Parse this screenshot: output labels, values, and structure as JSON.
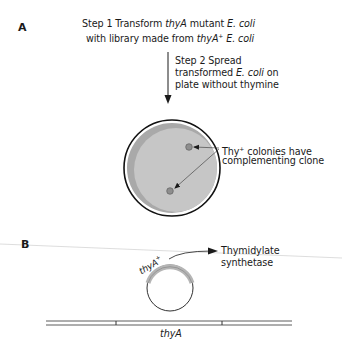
{
  "panel_a": {
    "label": "A",
    "step1": {
      "prefix": "Step 1   Transform ",
      "gene1": "thyA",
      "mid1": " mutant ",
      "organism1": "E. coli",
      "line2_prefix": "with library made from ",
      "gene2": "thyA",
      "gene2_sup": "+",
      "organism2": "E. coli"
    },
    "step2": {
      "line1": "Step 2   Spread",
      "line2_prefix": "transformed ",
      "organism": "E. coli",
      "line2_suffix": " on",
      "line3": "plate without thymine"
    },
    "colony_label": {
      "line1_prefix": "Thy",
      "line1_sup": "+",
      "line1_suffix": " colonies have",
      "line2": "complementing clone"
    }
  },
  "panel_b": {
    "label": "B",
    "plasmid_gene": "thyA",
    "plasmid_gene_sup": "+",
    "product_line1": "Thymidylate",
    "product_line2": "synthetase",
    "chromosome_gene": "thyA"
  },
  "colors": {
    "plate_fill": "#c6c6c6",
    "plate_shadow": "#a9a9a9",
    "colony": "#8e8e8e",
    "insert_arc": "#b5b5b5",
    "line": "#1a1a1a"
  }
}
